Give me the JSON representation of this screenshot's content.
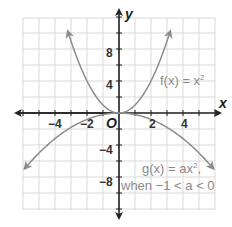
{
  "chart_data": {
    "type": "line",
    "title": "",
    "xlabel": "x",
    "ylabel": "y",
    "origin_label": "O",
    "xlim": [
      -6,
      6
    ],
    "ylim": [
      -12,
      12
    ],
    "grid": true,
    "x_ticks": [
      -4,
      -2,
      2,
      4
    ],
    "x_tick_labels": [
      "−4",
      "−2",
      "2",
      "4"
    ],
    "y_ticks": [
      -8,
      -4,
      4,
      8
    ],
    "y_tick_labels": [
      "−8",
      "−4",
      "4",
      "8"
    ],
    "series": [
      {
        "name": "f(x) = x²",
        "formula": "x^2",
        "x": [
          -3.2,
          -3,
          -2,
          -1,
          0,
          1,
          2,
          3,
          3.2
        ],
        "y": [
          10.24,
          9,
          4,
          1,
          0,
          1,
          4,
          9,
          10.24
        ]
      },
      {
        "name": "g(x) = ax², when −1 < a < 0",
        "formula": "a*x^2, a ≈ -0.2",
        "x": [
          -5.9,
          -4,
          -2,
          0,
          2,
          4,
          5.9
        ],
        "y": [
          -6.96,
          -3.2,
          -0.8,
          0,
          -0.8,
          -3.2,
          -6.96
        ]
      }
    ],
    "annotations": [
      {
        "text_prefix": "f(x) = x",
        "superscript": "2",
        "near": "upper right of f curve"
      },
      {
        "line1": "g(x) = ax²,",
        "line2": "when −1 < a < 0",
        "near": "lower right of g curve"
      }
    ]
  },
  "labels": {
    "x_axis": "x",
    "y_axis": "y",
    "origin": "O",
    "tick_x_m4": "−4",
    "tick_x_m2": "−2",
    "tick_x_2": "2",
    "tick_x_4": "4",
    "tick_y_8": "8",
    "tick_y_4": "4",
    "tick_y_m4": "−4",
    "tick_y_m8": "−8",
    "f_label": "f(x) = x",
    "f_sup": "2",
    "g_label_line1_a": "g(x) = ax",
    "g_label_line1_sup": "2",
    "g_label_line1_b": ",",
    "g_label_line2": "when −1 < a < 0"
  },
  "colors": {
    "grid": "#d9d9d9",
    "axes": "#222222",
    "curve": "#8c8c8c",
    "annotation": "#8a8a8a"
  }
}
